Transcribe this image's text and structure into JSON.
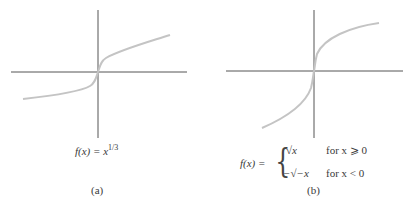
{
  "figure": {
    "panels": [
      {
        "id": "a",
        "caption": "(a)",
        "formula": {
          "lhs": "f(x) = x",
          "exponent": "1/3"
        }
      },
      {
        "id": "b",
        "caption": "(b)",
        "formula": {
          "lhs": "f(x) =",
          "cases": [
            {
              "expr": "√x",
              "cond": "for x ⩾ 0"
            },
            {
              "expr": "−√−x",
              "cond": "for x < 0"
            }
          ]
        }
      }
    ]
  },
  "colors": {
    "axis": "#2a2a2a",
    "curve": "#c4c4c4"
  }
}
